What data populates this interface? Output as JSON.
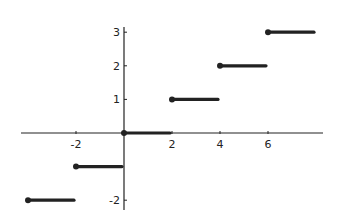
{
  "chart_data": {
    "type": "line",
    "title": "",
    "xlabel": "",
    "ylabel": "",
    "xlim": [
      -4,
      8
    ],
    "ylim": [
      -2,
      3
    ],
    "grid": false,
    "legend": null,
    "x_ticks": [
      -2,
      2,
      4,
      6
    ],
    "y_ticks": [
      -2,
      1,
      2,
      3
    ],
    "x_tick_labels": [
      "-2",
      "2",
      "4",
      "6"
    ],
    "y_tick_labels": [
      "-2",
      "1",
      "2",
      "3"
    ],
    "segments": [
      {
        "x_start": -4,
        "x_end": -2,
        "y": -2,
        "closed_start": true
      },
      {
        "x_start": -2,
        "x_end": 0,
        "y": -1,
        "closed_start": true
      },
      {
        "x_start": 0,
        "x_end": 2,
        "y": 0,
        "closed_start": true
      },
      {
        "x_start": 2,
        "x_end": 4,
        "y": 1,
        "closed_start": true
      },
      {
        "x_start": 4,
        "x_end": 6,
        "y": 2,
        "closed_start": true
      },
      {
        "x_start": 6,
        "x_end": 8,
        "y": 3,
        "closed_start": true
      }
    ],
    "color": "#222222"
  }
}
